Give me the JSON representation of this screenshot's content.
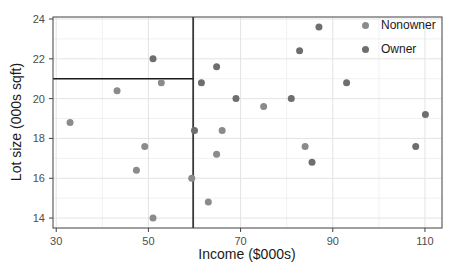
{
  "figure": {
    "type": "scatter-plot",
    "background": "#ffffff"
  },
  "chart_data": {
    "type": "scatter",
    "title": "",
    "xlabel": "Income ($000s)",
    "ylabel": "Lot size (000s sqft)",
    "xlim": [
      29.3,
      113.7
    ],
    "ylim": [
      13.5,
      24.1
    ],
    "xticks": [
      30,
      50,
      70,
      90,
      110
    ],
    "yticks": [
      14,
      16,
      18,
      20,
      22,
      24
    ],
    "x_minor_ticks": [
      40,
      60,
      80,
      100
    ],
    "y_minor_ticks": [
      15,
      17,
      19,
      21,
      23
    ],
    "grid": true,
    "legend_position": "top-right-inside",
    "series": [
      {
        "name": "Nonowner",
        "color": "#8b8b8b",
        "points": [
          [
            33,
            18.8
          ],
          [
            43.2,
            20.4
          ],
          [
            47.4,
            16.4
          ],
          [
            49.2,
            17.6
          ],
          [
            51,
            14.0
          ],
          [
            52.8,
            20.8
          ],
          [
            59.4,
            16.0
          ],
          [
            63,
            14.8
          ],
          [
            64.8,
            17.2
          ],
          [
            66,
            18.4
          ],
          [
            75,
            19.6
          ],
          [
            84,
            17.6
          ]
        ]
      },
      {
        "name": "Owner",
        "color": "#6e6e6e",
        "points": [
          [
            51,
            22.0
          ],
          [
            60,
            18.4
          ],
          [
            61.5,
            20.8
          ],
          [
            64.8,
            21.6
          ],
          [
            69,
            20.0
          ],
          [
            81,
            20.0
          ],
          [
            82.8,
            22.4
          ],
          [
            85.5,
            16.8
          ],
          [
            87,
            23.6
          ],
          [
            93,
            20.8
          ],
          [
            108,
            17.6
          ],
          [
            110.1,
            19.2
          ]
        ]
      }
    ],
    "split_lines": [
      {
        "orientation": "vertical",
        "x": 59.7,
        "from_y": 13.5,
        "to_y": 24.1
      },
      {
        "orientation": "horizontal",
        "y": 21.0,
        "from_x": 29.3,
        "to_x": 59.7
      }
    ],
    "style": {
      "point_radius": 3.5,
      "panel_border_color": "#404040",
      "grid_major_color": "#e3e3e3",
      "grid_minor_color": "#f1f1f1",
      "split_line_color": "#1a1a1a",
      "tick_label_color": "#4d4d4d",
      "axis_title_color": "#1a1a1a"
    }
  }
}
